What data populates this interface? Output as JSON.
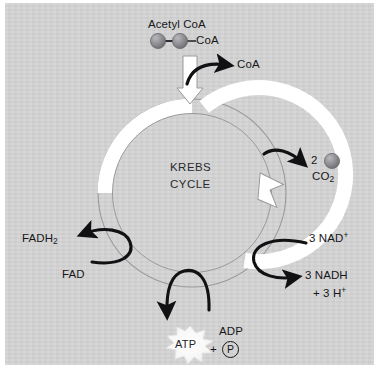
{
  "diagram": {
    "title_center": [
      "KREBS",
      "CYCLE"
    ],
    "background_color": "#d3d3d3",
    "ring_color": "#ffffff",
    "ring_outline_color": "#8d8d90",
    "arrow_color": "#111114",
    "sphere_color": "#8a8a8e",
    "labels": {
      "acetyl_coa": "Acetyl CoA",
      "coa_bound": "CoA",
      "coa_released": "CoA",
      "co2_count": "2",
      "co2": "CO",
      "co2_sub": "2",
      "fadh2": "FADH",
      "fadh2_sub": "2",
      "fad": "FAD",
      "nad_plus": "3 NAD",
      "nad_plus_sup": "+",
      "nadh": "3   NADH",
      "h_plus_prefix": "+ 3 H",
      "h_plus_sup": "+",
      "atp": "ATP",
      "adp": "ADP",
      "plus_sign": "+",
      "phosphate": "P"
    }
  }
}
